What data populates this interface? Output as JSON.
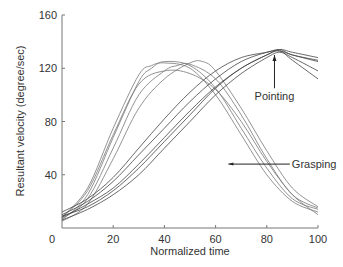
{
  "chart_data": {
    "type": "line",
    "title": "",
    "xlabel": "Normalized time",
    "ylabel": "Resultant velocity (degree/sec)",
    "xlim": [
      0,
      100
    ],
    "ylim": [
      0,
      160
    ],
    "xticks": [
      "0",
      "20",
      "40",
      "60",
      "80",
      "100"
    ],
    "yticks": [
      "40",
      "80",
      "120",
      "160"
    ],
    "grid": false,
    "annotations": [
      {
        "text": "Pointing",
        "arrow_to": [
          83,
          130
        ]
      },
      {
        "text": "Grasping",
        "arrow_to": [
          65,
          48
        ]
      }
    ],
    "series": [
      {
        "name": "Grasping 1",
        "group": "Grasping",
        "x": [
          0,
          10,
          20,
          30,
          35,
          40,
          50,
          60,
          70,
          80,
          90,
          100
        ],
        "y": [
          8,
          30,
          75,
          115,
          122,
          124,
          120,
          100,
          70,
          40,
          20,
          12
        ]
      },
      {
        "name": "Grasping 2",
        "group": "Grasping",
        "x": [
          0,
          10,
          20,
          30,
          35,
          40,
          50,
          60,
          70,
          80,
          90,
          100
        ],
        "y": [
          6,
          25,
          68,
          110,
          120,
          125,
          122,
          105,
          75,
          45,
          22,
          14
        ]
      },
      {
        "name": "Grasping 3",
        "group": "Grasping",
        "x": [
          0,
          10,
          20,
          30,
          40,
          45,
          50,
          60,
          70,
          80,
          90,
          100
        ],
        "y": [
          7,
          22,
          60,
          100,
          118,
          122,
          123,
          112,
          85,
          52,
          25,
          15
        ]
      },
      {
        "name": "Grasping 4",
        "group": "Grasping",
        "x": [
          0,
          10,
          20,
          30,
          40,
          50,
          55,
          60,
          70,
          80,
          90,
          100
        ],
        "y": [
          5,
          18,
          52,
          90,
          112,
          124,
          125,
          118,
          90,
          58,
          30,
          16
        ]
      },
      {
        "name": "Grasping 5",
        "group": "Grasping",
        "x": [
          0,
          10,
          20,
          30,
          40,
          50,
          60,
          70,
          80,
          90,
          100
        ],
        "y": [
          8,
          28,
          70,
          108,
          118,
          116,
          104,
          80,
          50,
          25,
          10
        ]
      },
      {
        "name": "Pointing 1",
        "group": "Pointing",
        "x": [
          0,
          10,
          20,
          30,
          40,
          50,
          60,
          70,
          80,
          85,
          90,
          100
        ],
        "y": [
          10,
          20,
          35,
          55,
          75,
          95,
          112,
          125,
          132,
          133,
          130,
          125
        ]
      },
      {
        "name": "Pointing 2",
        "group": "Pointing",
        "x": [
          0,
          10,
          20,
          30,
          40,
          50,
          60,
          70,
          80,
          85,
          90,
          100
        ],
        "y": [
          8,
          18,
          30,
          48,
          68,
          88,
          106,
          120,
          130,
          134,
          132,
          128
        ]
      },
      {
        "name": "Pointing 3",
        "group": "Pointing",
        "x": [
          0,
          10,
          20,
          30,
          40,
          50,
          60,
          70,
          80,
          85,
          90,
          100
        ],
        "y": [
          6,
          14,
          25,
          40,
          60,
          80,
          100,
          116,
          128,
          132,
          128,
          118
        ]
      },
      {
        "name": "Pointing 4",
        "group": "Pointing",
        "x": [
          0,
          10,
          20,
          30,
          40,
          50,
          60,
          70,
          80,
          85,
          90,
          100
        ],
        "y": [
          9,
          16,
          28,
          45,
          65,
          85,
          105,
          120,
          130,
          133,
          126,
          112
        ]
      },
      {
        "name": "Pointing 5",
        "group": "Pointing",
        "x": [
          0,
          10,
          20,
          30,
          40,
          50,
          60,
          70,
          80,
          85,
          90,
          100
        ],
        "y": [
          12,
          22,
          38,
          60,
          82,
          102,
          118,
          128,
          132,
          134,
          130,
          126
        ]
      }
    ]
  }
}
